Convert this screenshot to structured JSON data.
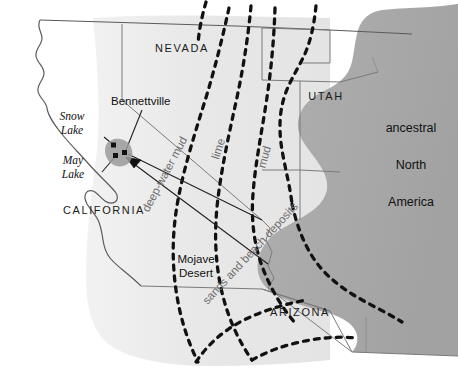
{
  "figure": {
    "kind": "paleogeographic-map",
    "width": 458,
    "height": 371,
    "background_color": "#ffffff"
  },
  "colors": {
    "craton_fill": "#a9a9a9",
    "shelf_fill": "#e6e6e6",
    "shelf_fill_soft": "#ededed",
    "coastline_stroke": "#4a4a4a",
    "state_border_stroke": "#6b6b6b",
    "facies_dash_stroke": "#111111",
    "facies_text": "#6e6e6e",
    "label_text": "#111111",
    "locality_marker": "#111111",
    "locality_halo": "#9a9a9a",
    "leader_line": "#222222"
  },
  "states": [
    {
      "id": "nevada",
      "label": "NEVADA",
      "x": 182,
      "y": 52
    },
    {
      "id": "utah",
      "label": "UTAH",
      "x": 326,
      "y": 100
    },
    {
      "id": "california",
      "label": "CALIFORNIA",
      "x": 104,
      "y": 214
    },
    {
      "id": "arizona",
      "label": "ARIZONA",
      "x": 300,
      "y": 316
    }
  ],
  "regions": [
    {
      "id": "mojave-desert",
      "label_line_1": "Mojave",
      "label_line_2": "Desert",
      "x": 196,
      "y": 263
    }
  ],
  "craton": {
    "id": "ancestral-north-america",
    "label_line_1": "ancestral",
    "label_line_2": "North",
    "label_line_3": "America",
    "x": 411,
    "y": 132,
    "line_gap": 37
  },
  "localities": [
    {
      "id": "bennettville",
      "label": "Bennettville",
      "label_x": 111,
      "label_y": 105,
      "marker_x": 124,
      "marker_y": 153,
      "leader": "M 142 110 L 125.5 150"
    },
    {
      "id": "snow-lake",
      "label_line_1": "Snow",
      "label_line_2": "Lake",
      "label_x": 72,
      "label_y": 120,
      "marker_x": 114,
      "marker_y": 146,
      "leader": "M 104 137 L 112 144"
    },
    {
      "id": "may-lake",
      "label_line_1": "May",
      "label_line_2": "Lake",
      "label_x": 73,
      "label_y": 164,
      "marker_x": 116,
      "marker_y": 156,
      "leader": "M 104 172 L 114.5 158.5"
    }
  ],
  "facies_belts": [
    {
      "id": "deep-water-mud",
      "label": "deep-water mud",
      "text_x": 168,
      "text_y": 176,
      "rotation": -62,
      "letter_spacing": 0.4
    },
    {
      "id": "lime",
      "label": "lime",
      "text_x": 222,
      "text_y": 150,
      "rotation": -72,
      "letter_spacing": 0.4
    },
    {
      "id": "mud",
      "label": "mud",
      "text_x": 268,
      "text_y": 158,
      "rotation": -74,
      "letter_spacing": 0.4
    },
    {
      "id": "sands-and-beach-deposits",
      "label": "sands and beach deposits",
      "text_x": 253,
      "text_y": 256,
      "rotation": -47,
      "letter_spacing": 0.4
    }
  ],
  "legend_notes": {
    "dashed_lines_meaning": "facies boundaries",
    "gray_landmass_meaning": "ancestral North America"
  }
}
